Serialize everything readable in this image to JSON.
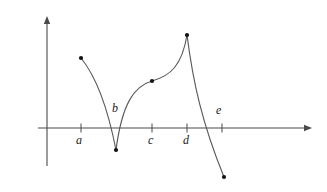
{
  "figure": {
    "kind": "calculus-graph",
    "background": "#ffffff",
    "ink_color": "#4a4a4a",
    "curve_color": "#5a5a5a",
    "point_color": "#111111",
    "label_color": "#1a1a1a",
    "width": 327,
    "height": 192
  },
  "axes": {
    "x_axis": {
      "y": 128,
      "x_start": 38,
      "x_end": 312,
      "arrow": "right"
    },
    "y_axis": {
      "x": 47,
      "y_top": 16,
      "y_bottom": 166,
      "arrow": "up"
    }
  },
  "ticks": [
    {
      "name": "a",
      "x": 81,
      "label": "a",
      "label_x": 76,
      "label_y": 134,
      "label_side": "below"
    },
    {
      "name": "b",
      "x": 116,
      "label": "b",
      "label_x": 112,
      "label_y": 102,
      "label_side": "above",
      "tick_drawn": false
    },
    {
      "name": "c",
      "x": 152,
      "label": "c",
      "label_x": 148,
      "label_y": 134,
      "label_side": "below"
    },
    {
      "name": "d",
      "x": 187,
      "label": "d",
      "label_x": 183,
      "label_y": 134,
      "label_side": "below"
    },
    {
      "name": "e",
      "x": 222,
      "label": "e",
      "label_x": 216,
      "label_y": 104,
      "label_side": "above"
    }
  ],
  "curve": {
    "description": "Decreasing concave-down arc from left endpoint down to a cusp minimum at b, then rising concave-down to an inflection plateau at c, rising steeply to a maximum at d, then dropping steeply and crossing the x-axis to a lower-right endpoint.",
    "segments": [
      {
        "name": "arc-a-to-b",
        "path": "M 81,58 C 94,74 107,104 116,150"
      },
      {
        "name": "arc-b-to-c",
        "path": "M 116,150 C 122,104 134,86 152,81"
      },
      {
        "name": "arc-c-to-d",
        "path": "M 152,81 C 170,76 182,66 187,35"
      },
      {
        "name": "arc-d-to-end",
        "path": "M 187,35 C 193,82 202,123 224,177"
      }
    ]
  },
  "marked_points": [
    {
      "name": "left-endpoint",
      "x": 81,
      "y": 58
    },
    {
      "name": "cusp-minimum-at-b",
      "x": 116,
      "y": 150
    },
    {
      "name": "inflection-at-c",
      "x": 152,
      "y": 81
    },
    {
      "name": "maximum-at-d",
      "x": 187,
      "y": 35
    },
    {
      "name": "right-endpoint",
      "x": 224,
      "y": 177
    }
  ]
}
